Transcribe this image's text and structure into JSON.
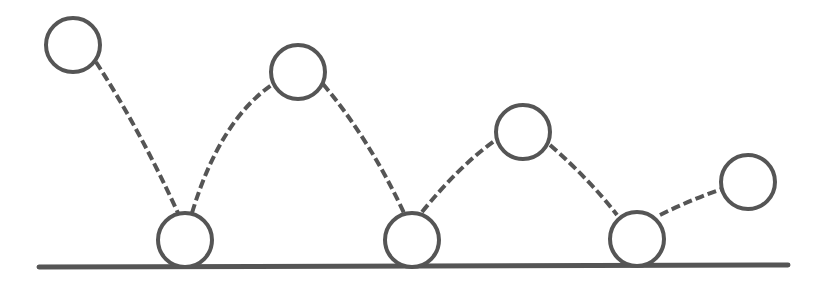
{
  "diagram": {
    "title": "",
    "colors": {
      "stroke": "#555555",
      "background": "#ffffff",
      "fill": "#ffffff"
    },
    "ground": {
      "x1": 39,
      "y1": 267,
      "x2": 788,
      "y2": 265,
      "stroke_width": 5
    },
    "ball_radius": 27,
    "balls": [
      {
        "id": "ball-1",
        "cx": 73,
        "cy": 45,
        "position": "peak"
      },
      {
        "id": "ball-2",
        "cx": 185,
        "cy": 240,
        "position": "ground"
      },
      {
        "id": "ball-3",
        "cx": 298,
        "cy": 72,
        "position": "peak"
      },
      {
        "id": "ball-4",
        "cx": 412,
        "cy": 240,
        "position": "ground"
      },
      {
        "id": "ball-5",
        "cx": 523,
        "cy": 132,
        "position": "peak"
      },
      {
        "id": "ball-6",
        "cx": 637,
        "cy": 239,
        "position": "ground"
      },
      {
        "id": "ball-7",
        "cx": 748,
        "cy": 182,
        "position": "peak"
      }
    ],
    "paths": [
      {
        "id": "path-1-2",
        "d": "M 96 62 Q 140 130 178 213"
      },
      {
        "id": "path-2-3",
        "d": "M 192 213 Q 220 120 273 84"
      },
      {
        "id": "path-3-4",
        "d": "M 323 84 Q 370 140 404 213"
      },
      {
        "id": "path-4-5",
        "d": "M 422 212 Q 460 165 497 139"
      },
      {
        "id": "path-5-6",
        "d": "M 550 145 Q 590 180 617 215"
      },
      {
        "id": "path-6-7",
        "d": "M 660 215 Q 690 200 722 189"
      }
    ]
  }
}
